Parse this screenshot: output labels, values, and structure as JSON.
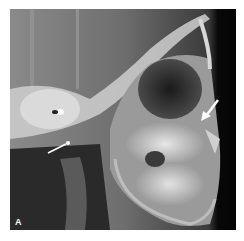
{
  "figure": {
    "panel_label": "A",
    "arrows": [
      {
        "name": "right-arrow",
        "direction": "down-left",
        "color": "#ffffff"
      },
      {
        "name": "left-arrow",
        "direction": "up-right",
        "color": "#ffffff"
      }
    ],
    "colors": {
      "background": "#ffffff",
      "film_dark": "#0a0a0a",
      "bone_light": "#e8e8e8",
      "soft_tissue": "#6a6a6a"
    }
  }
}
